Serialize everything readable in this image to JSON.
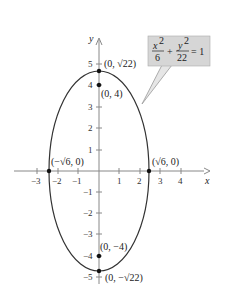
{
  "figure": {
    "equation": {
      "x_num": "x",
      "x_exp": "2",
      "x_den": "6",
      "plus": "+",
      "y_num": "y",
      "y_exp": "2",
      "y_den": "22",
      "rhs": "= 1"
    },
    "axes": {
      "x_label": "x",
      "y_label": "y",
      "x_ticks": [
        "−3",
        "−2",
        "−1",
        "1",
        "2",
        "3",
        "4"
      ],
      "y_ticks": [
        "5",
        "4",
        "3",
        "2",
        "1",
        "−1",
        "−2",
        "−3",
        "−4",
        "−5"
      ]
    },
    "points": {
      "top_vertex": "(0, √22)",
      "top_focus": "(0, 4)",
      "left_covertex": "(−√6, 0)",
      "right_covertex": "(√6, 0)",
      "bottom_focus": "(0, −4)",
      "bottom_vertex": "(0, −√22)"
    },
    "colors": {
      "curve": "#333333",
      "axis": "#777777",
      "box": "#d4d4d4",
      "point": "#111111"
    }
  }
}
